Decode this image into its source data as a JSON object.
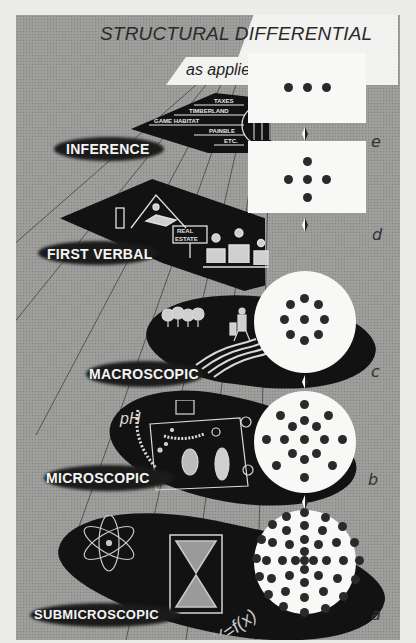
{
  "title": {
    "main": "STRUCTURAL DIFFERENTIAL",
    "subtitle": "as applied to \"Land\""
  },
  "levels": [
    {
      "key": "e",
      "label": "INFERENCE",
      "card_shape": "rectangle",
      "dots": 3,
      "illustration": [
        "TAXES",
        "TIMBERLAND",
        "GAME HABITAT",
        "PAINBLE",
        "ETC."
      ]
    },
    {
      "key": "d",
      "label": "FIRST VERBAL",
      "card_shape": "rectangle",
      "dots": 5,
      "illustration": [
        "house",
        "REAL ESTATE",
        "people-at-table"
      ]
    },
    {
      "key": "c",
      "label": "MACROSCOPIC",
      "card_shape": "circle",
      "dots": 9,
      "illustration": [
        "trees",
        "farmer",
        "plowed-field"
      ]
    },
    {
      "key": "b",
      "label": "MICROSCOPIC",
      "card_shape": "circle",
      "dots": 17,
      "illustration": [
        "pH",
        "microscope",
        "microbes",
        "snowflakes"
      ]
    },
    {
      "key": "a",
      "label": "SUBMICROSCOPIC",
      "card_shape": "circle",
      "dots": 60,
      "illustration": [
        "atom",
        "hourglass",
        "Y=f(x)"
      ]
    }
  ],
  "icons": {
    "atom": "atom-icon",
    "hourglass": "hourglass-icon",
    "equation": "Y=f(x)",
    "ph": "pH"
  },
  "colors": {
    "background": "#9c9c9a",
    "blob": "#121212",
    "card": "#f8f8f6",
    "dot": "#2a2a2a",
    "page": "#ececea"
  }
}
